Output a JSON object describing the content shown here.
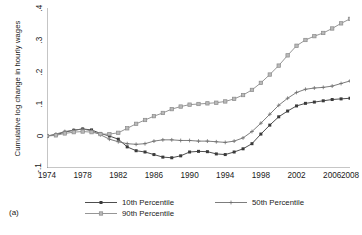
{
  "panel_label": "(a)",
  "axes": {
    "ylabel": "Cumulative log change in hourly wages",
    "ytick_labels": [
      "-.1",
      "0",
      ".1",
      ".2",
      ".3",
      ".4"
    ],
    "xtick_labels": [
      "1974",
      "1978",
      "1982",
      "1986",
      "1990",
      "1994",
      "1998",
      "2002",
      "2006",
      "2008"
    ]
  },
  "legend": {
    "items": [
      {
        "label": "10th Percentile",
        "marker": "filled-square-marker",
        "color": "#3a3a3a"
      },
      {
        "label": "50th Percentile",
        "marker": "plus-marker",
        "color": "#6e6e6e"
      },
      {
        "label": "90th Percentile",
        "marker": "open-square-marker",
        "color": "#8a8a8a"
      }
    ]
  },
  "chart_data": {
    "type": "line",
    "title": "",
    "xlabel": "",
    "ylabel": "Cumulative log change in hourly wages",
    "xlim": [
      1974,
      2008
    ],
    "ylim": [
      -0.1,
      0.4
    ],
    "grid": false,
    "legend_position": "bottom",
    "x": [
      1974,
      1975,
      1976,
      1977,
      1978,
      1979,
      1980,
      1981,
      1982,
      1983,
      1984,
      1985,
      1986,
      1987,
      1988,
      1989,
      1990,
      1991,
      1992,
      1993,
      1994,
      1995,
      1996,
      1997,
      1998,
      1999,
      2000,
      2001,
      2002,
      2003,
      2004,
      2005,
      2006,
      2007,
      2008
    ],
    "series": [
      {
        "name": "10th Percentile",
        "marker": "filled-square-marker",
        "color": "#3a3a3a",
        "values": [
          0.0,
          0.004,
          0.012,
          0.018,
          0.022,
          0.019,
          0.008,
          0.0,
          -0.01,
          -0.034,
          -0.046,
          -0.05,
          -0.058,
          -0.066,
          -0.068,
          -0.062,
          -0.05,
          -0.048,
          -0.049,
          -0.056,
          -0.058,
          -0.05,
          -0.04,
          -0.024,
          0.006,
          0.034,
          0.06,
          0.078,
          0.094,
          0.102,
          0.106,
          0.11,
          0.114,
          0.116,
          0.118
        ]
      },
      {
        "name": "50th Percentile",
        "marker": "plus-marker",
        "color": "#6e6e6e",
        "values": [
          0.0,
          0.006,
          0.014,
          0.018,
          0.022,
          0.016,
          0.004,
          -0.01,
          -0.018,
          -0.024,
          -0.026,
          -0.024,
          -0.016,
          -0.012,
          -0.012,
          -0.014,
          -0.014,
          -0.016,
          -0.016,
          -0.018,
          -0.02,
          -0.016,
          -0.006,
          0.014,
          0.04,
          0.068,
          0.096,
          0.118,
          0.136,
          0.146,
          0.15,
          0.152,
          0.156,
          0.164,
          0.172
        ]
      },
      {
        "name": "90th Percentile",
        "marker": "open-square-marker",
        "color": "#8a8a8a",
        "values": [
          0.0,
          0.002,
          0.008,
          0.012,
          0.014,
          0.012,
          0.006,
          0.006,
          0.01,
          0.024,
          0.038,
          0.05,
          0.062,
          0.072,
          0.084,
          0.092,
          0.098,
          0.1,
          0.102,
          0.104,
          0.108,
          0.116,
          0.128,
          0.144,
          0.166,
          0.192,
          0.22,
          0.252,
          0.282,
          0.3,
          0.312,
          0.322,
          0.336,
          0.352,
          0.366
        ]
      }
    ]
  }
}
